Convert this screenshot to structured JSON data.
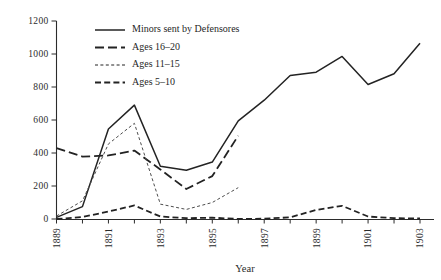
{
  "chart_data": {
    "type": "line",
    "title": "",
    "xlabel": "Year",
    "ylabel": "",
    "xlim": [
      1889,
      1903
    ],
    "ylim": [
      0,
      1200
    ],
    "grid": false,
    "legend_position": "top-left",
    "x": [
      1889,
      1890,
      1891,
      1892,
      1893,
      1894,
      1895,
      1896,
      1897,
      1898,
      1899,
      1900,
      1901,
      1902,
      1903
    ],
    "xticks": [
      "1889",
      "1891",
      "1893",
      "1895",
      "1897",
      "1899",
      "1901",
      "1903"
    ],
    "xtick_values": [
      1889,
      1891,
      1893,
      1895,
      1897,
      1899,
      1901,
      1903
    ],
    "yticks": [
      "0",
      "200",
      "400",
      "600",
      "800",
      "1000",
      "1200"
    ],
    "ytick_values": [
      0,
      200,
      400,
      600,
      800,
      1000,
      1200
    ],
    "series": [
      {
        "name": "Minors sent by Defensores",
        "style": "solid",
        "x": [
          1889,
          1890,
          1891,
          1892,
          1893,
          1894,
          1895,
          1896,
          1897,
          1898,
          1899,
          1900,
          1901,
          1902,
          1903
        ],
        "values": [
          10,
          75,
          545,
          690,
          320,
          295,
          345,
          595,
          720,
          870,
          890,
          985,
          815,
          880,
          1065
        ]
      },
      {
        "name": "Ages 16–20",
        "style": "long-dash",
        "x": [
          1889,
          1890,
          1891,
          1892,
          1893,
          1894,
          1895,
          1896
        ],
        "values": [
          430,
          378,
          385,
          415,
          300,
          182,
          260,
          505
        ]
      },
      {
        "name": "Ages 11–15",
        "style": "dotted",
        "x": [
          1889,
          1890,
          1891,
          1892,
          1893,
          1894,
          1895,
          1896
        ],
        "values": [
          18,
          110,
          455,
          580,
          90,
          58,
          100,
          190
        ]
      },
      {
        "name": "Ages 5–10",
        "style": "dashed",
        "x": [
          1889,
          1890,
          1891,
          1892,
          1893,
          1894,
          1895,
          1896,
          1897,
          1898,
          1899,
          1900,
          1901,
          1902,
          1903
        ],
        "values": [
          0,
          12,
          45,
          82,
          15,
          5,
          8,
          0,
          2,
          10,
          55,
          80,
          15,
          5,
          3
        ]
      }
    ],
    "colors": {
      "ink": "#232323",
      "light_ink": "#4d4d4d",
      "background": "#ffffff"
    }
  },
  "legend": {
    "entries": [
      {
        "label": "Minors sent by Defensores"
      },
      {
        "label": "Ages 16–20"
      },
      {
        "label": "Ages 11–15"
      },
      {
        "label": "Ages 5–10"
      }
    ]
  },
  "axes": {
    "x_title": "Year"
  }
}
